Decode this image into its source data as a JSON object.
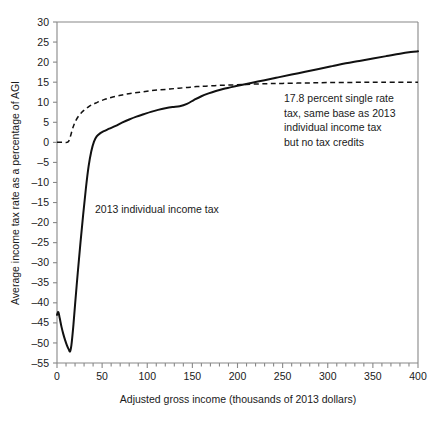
{
  "chart_data": {
    "type": "line",
    "title": "",
    "xlabel": "Adjusted gross income (thousands of 2013 dollars)",
    "ylabel": "Average income tax rate as a percentage of AGI",
    "xlim": [
      0,
      400
    ],
    "ylim": [
      -55,
      30
    ],
    "xticks": [
      0,
      50,
      100,
      150,
      200,
      250,
      300,
      350,
      400
    ],
    "xticklabels": [
      "0",
      "50",
      "100",
      "150",
      "200",
      "250",
      "300",
      "350",
      "400"
    ],
    "yticks": [
      -55,
      -50,
      -45,
      -40,
      -35,
      -30,
      -25,
      -20,
      -15,
      -10,
      -5,
      0,
      5,
      10,
      15,
      20,
      25,
      30
    ],
    "yticklabels": [
      "–55",
      "–50",
      "–45",
      "–40",
      "–35",
      "–30",
      "–25",
      "–20",
      "–15",
      "–10",
      "–5",
      "0",
      "5",
      "10",
      "15",
      "20",
      "25",
      "30"
    ],
    "grid": false,
    "legend_position": "inline-annotations",
    "series": [
      {
        "name": "2013 individual income tax",
        "style": "solid",
        "color": "#111111",
        "points": [
          [
            0,
            -43.0
          ],
          [
            1.5,
            -42.3
          ],
          [
            3,
            -43.8
          ],
          [
            5,
            -46.0
          ],
          [
            7,
            -47.8
          ],
          [
            9,
            -49.3
          ],
          [
            11,
            -50.6
          ],
          [
            13,
            -51.6
          ],
          [
            14.5,
            -52.1
          ],
          [
            16,
            -50.5
          ],
          [
            18,
            -46.0
          ],
          [
            20,
            -40.5
          ],
          [
            23,
            -32.5
          ],
          [
            26,
            -25.0
          ],
          [
            29,
            -18.0
          ],
          [
            32,
            -11.5
          ],
          [
            35,
            -6.0
          ],
          [
            38,
            -2.2
          ],
          [
            41,
            0.2
          ],
          [
            44,
            1.5
          ],
          [
            48,
            2.3
          ],
          [
            52,
            2.8
          ],
          [
            58,
            3.4
          ],
          [
            65,
            4.1
          ],
          [
            72,
            4.9
          ],
          [
            80,
            5.7
          ],
          [
            88,
            6.4
          ],
          [
            96,
            7.0
          ],
          [
            104,
            7.6
          ],
          [
            112,
            8.1
          ],
          [
            120,
            8.5
          ],
          [
            128,
            8.8
          ],
          [
            136,
            9.0
          ],
          [
            144,
            9.6
          ],
          [
            152,
            10.6
          ],
          [
            160,
            11.5
          ],
          [
            168,
            12.2
          ],
          [
            176,
            12.8
          ],
          [
            184,
            13.3
          ],
          [
            192,
            13.7
          ],
          [
            200,
            14.1
          ],
          [
            215,
            14.8
          ],
          [
            230,
            15.5
          ],
          [
            245,
            16.2
          ],
          [
            260,
            16.9
          ],
          [
            275,
            17.6
          ],
          [
            290,
            18.3
          ],
          [
            305,
            19.0
          ],
          [
            320,
            19.7
          ],
          [
            335,
            20.3
          ],
          [
            350,
            20.9
          ],
          [
            365,
            21.5
          ],
          [
            380,
            22.1
          ],
          [
            392,
            22.5
          ],
          [
            400,
            22.7
          ]
        ]
      },
      {
        "name": "17.8 percent single rate tax, same base as 2013 individual income tax but no tax credits",
        "style": "dashed",
        "color": "#111111",
        "points": [
          [
            0,
            0.0
          ],
          [
            4,
            0.0
          ],
          [
            8,
            0.0
          ],
          [
            11,
            0.0
          ],
          [
            13,
            0.3
          ],
          [
            15,
            1.6
          ],
          [
            17,
            3.2
          ],
          [
            19,
            4.5
          ],
          [
            21,
            5.5
          ],
          [
            24,
            6.6
          ],
          [
            27,
            7.4
          ],
          [
            30,
            8.0
          ],
          [
            34,
            8.7
          ],
          [
            38,
            9.3
          ],
          [
            43,
            9.8
          ],
          [
            48,
            10.3
          ],
          [
            54,
            10.8
          ],
          [
            60,
            11.2
          ],
          [
            68,
            11.6
          ],
          [
            76,
            12.0
          ],
          [
            85,
            12.3
          ],
          [
            95,
            12.6
          ],
          [
            105,
            12.9
          ],
          [
            115,
            13.1
          ],
          [
            125,
            13.3
          ],
          [
            135,
            13.5
          ],
          [
            145,
            13.7
          ],
          [
            155,
            13.9
          ],
          [
            165,
            14.0
          ],
          [
            180,
            14.2
          ],
          [
            195,
            14.3
          ],
          [
            210,
            14.45
          ],
          [
            230,
            14.6
          ],
          [
            250,
            14.7
          ],
          [
            275,
            14.8
          ],
          [
            300,
            14.9
          ],
          [
            330,
            14.95
          ],
          [
            360,
            15.0
          ],
          [
            400,
            15.0
          ]
        ]
      }
    ],
    "annotations": [
      {
        "id": "solid-series-label",
        "text": "2013 individual income tax",
        "lines": [
          "2013 individual income tax"
        ],
        "x_px": 95,
        "y_px": 213
      },
      {
        "id": "dashed-series-label",
        "text": "17.8 percent single rate tax, same base as 2013 individual income tax but no tax credits",
        "lines": [
          "17.8 percent single rate",
          "tax, same base as 2013",
          "individual income tax",
          "but no tax credits"
        ],
        "x_px": 284,
        "y_px": 102
      }
    ]
  }
}
